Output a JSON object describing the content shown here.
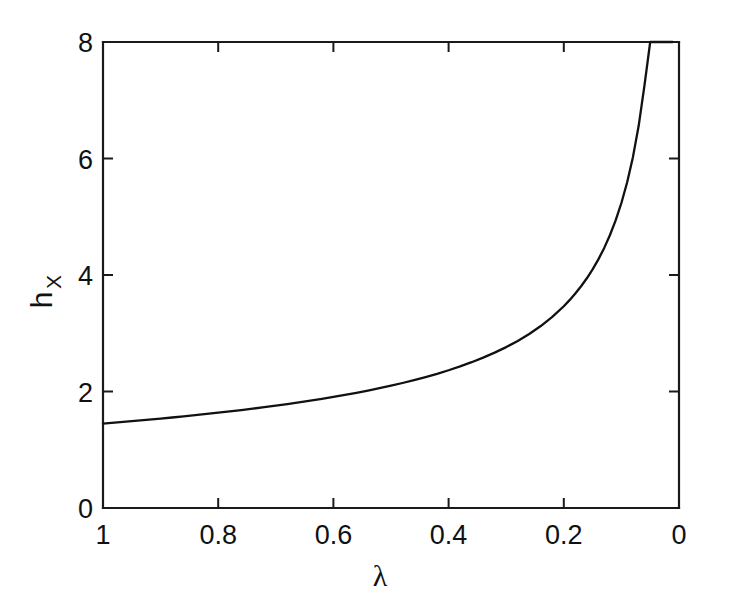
{
  "chart_data": {
    "type": "line",
    "title": "",
    "subtitle": "",
    "xlabel": "λ",
    "ylabel": "h",
    "ylabel_subscript": "X",
    "xlim": [
      1,
      0
    ],
    "ylim": [
      0,
      8
    ],
    "x_axis_reversed": true,
    "grid": false,
    "legend": null,
    "xticks": [
      1,
      0.8,
      0.6,
      0.4,
      0.2,
      0
    ],
    "xticklabels": [
      "1",
      "0.8",
      "0.6",
      "0.4",
      "0.2",
      "0"
    ],
    "yticks": [
      0,
      2,
      4,
      6,
      8
    ],
    "yticklabels": [
      "0",
      "2",
      "4",
      "6",
      "8"
    ],
    "series": [
      {
        "name": "h_X",
        "color": "#111111",
        "linewidth": 2.3,
        "x": [
          1.0,
          0.98,
          0.96,
          0.94,
          0.92,
          0.9,
          0.88,
          0.86,
          0.84,
          0.82,
          0.8,
          0.78,
          0.76,
          0.74,
          0.72,
          0.7,
          0.68,
          0.66,
          0.64,
          0.62,
          0.6,
          0.58,
          0.56,
          0.54,
          0.52,
          0.5,
          0.48,
          0.46,
          0.44,
          0.42,
          0.4,
          0.38,
          0.36,
          0.34,
          0.32,
          0.3,
          0.28,
          0.26,
          0.24,
          0.22,
          0.2,
          0.19,
          0.18,
          0.17,
          0.16,
          0.15,
          0.14,
          0.13,
          0.12,
          0.11,
          0.1,
          0.09,
          0.08,
          0.07,
          0.06,
          0.05,
          0.045,
          0.04,
          0.035,
          0.03,
          0.025,
          0.022,
          0.02,
          0.018,
          0.016,
          0.014,
          0.013,
          0.012,
          0.0115,
          0.0112
        ],
        "y": [
          1.45,
          1.466,
          1.483,
          1.5,
          1.518,
          1.536,
          1.554,
          1.574,
          1.594,
          1.614,
          1.636,
          1.658,
          1.681,
          1.705,
          1.73,
          1.756,
          1.783,
          1.812,
          1.842,
          1.873,
          1.906,
          1.941,
          1.977,
          2.016,
          2.057,
          2.1,
          2.146,
          2.195,
          2.248,
          2.304,
          2.365,
          2.431,
          2.503,
          2.581,
          2.667,
          2.762,
          2.868,
          2.988,
          3.124,
          3.28,
          3.464,
          3.568,
          3.682,
          3.807,
          3.944,
          4.097,
          4.268,
          4.461,
          4.682,
          4.937,
          5.236,
          5.592,
          6.023,
          6.561,
          7.25,
          8.0,
          8.0,
          8.0,
          8.0,
          8.0,
          8.0,
          8.0,
          8.0,
          8.0,
          8.0,
          8.0,
          8.0,
          8.0,
          8.0,
          8.0
        ]
      }
    ],
    "annotations": []
  },
  "figure": {
    "background_color": "#ffffff",
    "axis_color": "#1a1a1a",
    "curve_color": "#111111"
  }
}
